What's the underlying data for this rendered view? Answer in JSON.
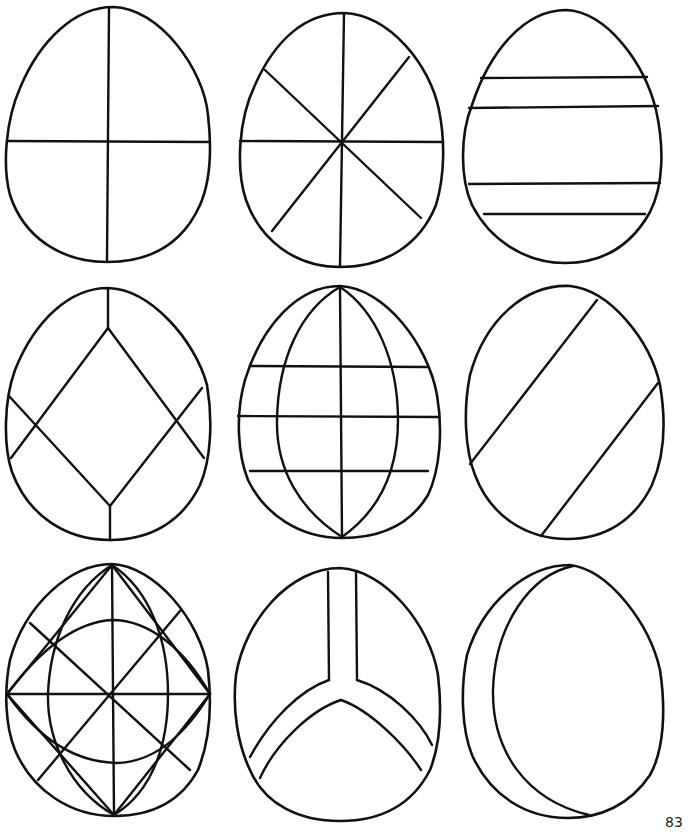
{
  "page": {
    "number": "83",
    "background": "#ffffff",
    "ink_color": "#111111"
  },
  "eggs": [
    {
      "row": 1,
      "col": 1,
      "pattern": "cross-quartered"
    },
    {
      "row": 1,
      "col": 2,
      "pattern": "eight-segment-star"
    },
    {
      "row": 1,
      "col": 3,
      "pattern": "two-horizontal-bands"
    },
    {
      "row": 2,
      "col": 1,
      "pattern": "diamond-with-crossing-diagonals"
    },
    {
      "row": 2,
      "col": 2,
      "pattern": "meridians-and-three-latitudes"
    },
    {
      "row": 2,
      "col": 3,
      "pattern": "diagonal-band"
    },
    {
      "row": 3,
      "col": 1,
      "pattern": "star-with-lens-arcs"
    },
    {
      "row": 3,
      "col": 2,
      "pattern": "y-shaped-band"
    },
    {
      "row": 3,
      "col": 3,
      "pattern": "crescent-side-band"
    }
  ]
}
